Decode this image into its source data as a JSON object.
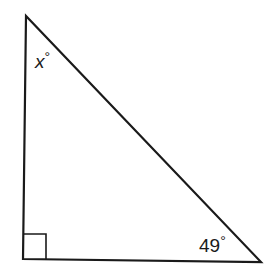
{
  "diagram": {
    "type": "right-triangle",
    "angles": {
      "top": {
        "label_var": "x",
        "label_deg": "°"
      },
      "bottom_right": {
        "label_num": "49",
        "label_deg": "°"
      },
      "bottom_left": {
        "marker": "right-angle"
      }
    },
    "colors": {
      "stroke": "#1a1a1a",
      "background": "#ffffff"
    }
  }
}
